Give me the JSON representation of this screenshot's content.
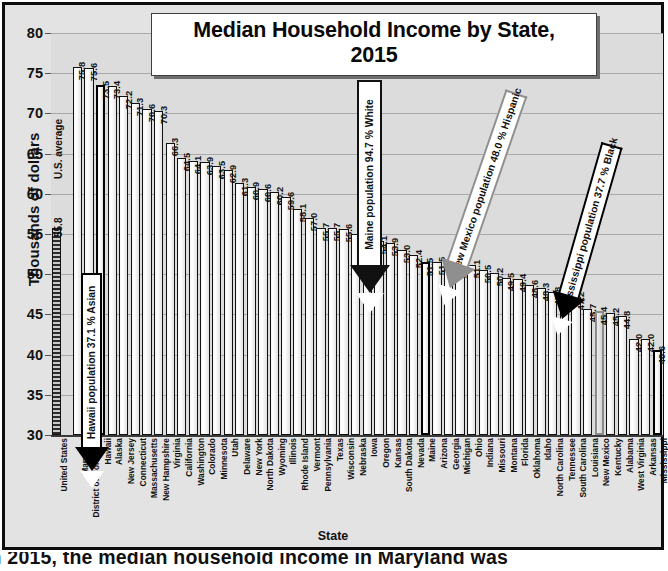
{
  "chart_data": {
    "type": "bar",
    "title": "Median Household Income by State, 2015",
    "title_line1": "Median Household Income by State,",
    "title_line2": "2015",
    "xlabel": "State",
    "ylabel": "Thousands of dollars",
    "ylim": [
      30,
      80
    ],
    "ytick_labels": [
      "80",
      "75",
      "70",
      "65",
      "60",
      "55",
      "50",
      "45",
      "40",
      "35",
      "30"
    ],
    "yticks": [
      80,
      75,
      70,
      65,
      60,
      55,
      50,
      45,
      40,
      35,
      30
    ],
    "grid": true,
    "legend": "none",
    "reference_label": "U.S. average",
    "categories": [
      "United States",
      "Maryland",
      "District of Columbia",
      "Hawaii",
      "Alaska",
      "New Jersey",
      "Connecticut",
      "Massachusetts",
      "New Hampshire",
      "Virginia",
      "California",
      "Washington",
      "Colorado",
      "Minnesota",
      "Utah",
      "Delaware",
      "New York",
      "North Dakota",
      "Wyoming",
      "Illinois",
      "Rhode Island",
      "Vermont",
      "Pennsylvania",
      "Texas",
      "Wisconsin",
      "Nebraska",
      "Iowa",
      "Oregon",
      "Kansas",
      "South Dakota",
      "Nevada",
      "Maine",
      "Arizona",
      "Georgia",
      "Michigan",
      "Ohio",
      "Indiana",
      "Missouri",
      "Montana",
      "Florida",
      "Oklahoma",
      "Idaho",
      "North Carolina",
      "Tennessee",
      "South Carolina",
      "Louisiana",
      "New Mexico",
      "Kentucky",
      "Alabama",
      "West Virginia",
      "Arkansas",
      "Mississippi"
    ],
    "values": [
      55.8,
      75.8,
      75.6,
      73.5,
      73.4,
      72.2,
      71.3,
      70.6,
      70.3,
      66.3,
      64.5,
      64.1,
      63.9,
      63.5,
      62.9,
      61.3,
      60.9,
      60.6,
      60.2,
      59.6,
      58.1,
      57.0,
      55.7,
      55.7,
      55.6,
      55.0,
      54.7,
      54.1,
      53.9,
      53.0,
      52.4,
      51.5,
      51.5,
      51.2,
      51.1,
      51.1,
      50.5,
      50.2,
      49.5,
      49.4,
      48.6,
      48.3,
      47.8,
      47.3,
      47.2,
      45.7,
      45.4,
      45.2,
      44.8,
      42.0,
      42.0,
      40.6
    ],
    "value_labels": [
      "55.8",
      "75.8",
      "75.6",
      "73.5",
      "73.4",
      "72.2",
      "71.3",
      "70.6",
      "70.3",
      "66.3",
      "64.5",
      "64.1",
      "63.9",
      "63.5",
      "62.9",
      "61.3",
      "60.9",
      "60.6",
      "60.2",
      "59.6",
      "58.1",
      "57.0",
      "55.7",
      "55.7",
      "55.6",
      "55.0",
      "54.7",
      "54.1",
      "53.9",
      "53.0",
      "52.4",
      "51.5",
      "51.5",
      "51.2",
      "51.1",
      "51.1",
      "50.5",
      "50.2",
      "49.5",
      "49.4",
      "48.6",
      "48.3",
      "47.8",
      "47.3",
      "47.2",
      "45.7",
      "45.4",
      "45.2",
      "44.8",
      "42.0",
      "42.0",
      "40.6"
    ],
    "highlighted": [
      "Hawaii",
      "Maine",
      "New Mexico",
      "Mississippi"
    ],
    "annotations": [
      {
        "id": "hawaii",
        "text": "Hawaii population 37.1 % Asian",
        "target": "Hawaii",
        "outline": "#000000"
      },
      {
        "id": "maine",
        "text": "Maine population 94.7 % White",
        "target": "Maine",
        "outline": "#111111"
      },
      {
        "id": "new-mexico",
        "text": "New Mexico population 48.0 % Hispanic",
        "target": "New Mexico",
        "outline": "#8f8f8f"
      },
      {
        "id": "mississippi",
        "text": "Mississippi population 37.7 % Black",
        "target": "Mississippi",
        "outline": "#000000"
      }
    ]
  },
  "caption": {
    "text": "In 2015, the median household income in Maryland was"
  },
  "colors": {
    "frame": "#0d0d0d",
    "plot_background": "#dcdcdc",
    "figure_background": "#e3e3e3",
    "gridline": "#a9a9a9",
    "bar_fill": "#f2f2f2",
    "bar_outline": "#111111",
    "us_average_fill": "#8a8a8a",
    "highlight_grey": "#8f8f8f"
  }
}
